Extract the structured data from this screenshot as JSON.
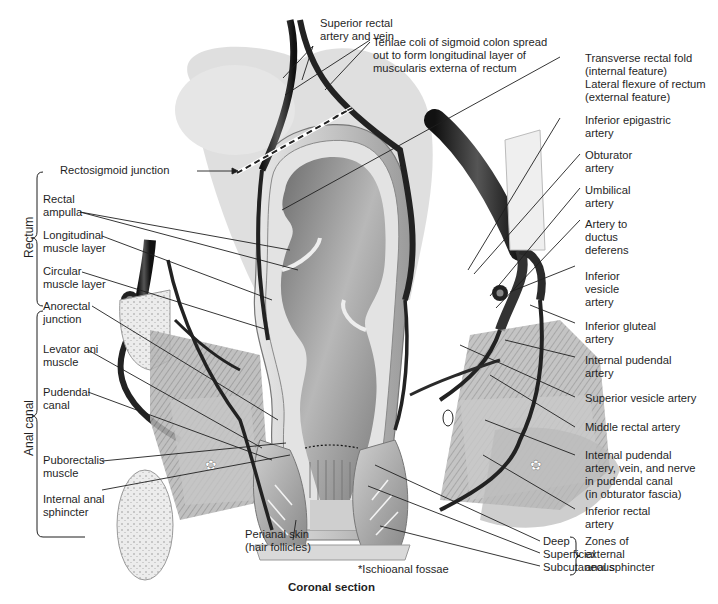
{
  "figure": {
    "caption": "Coronal section",
    "footnote": "*Ischioanal fossae"
  },
  "groups": {
    "rectum": "Rectum",
    "anal_canal": "Anal canal",
    "zones": "Zones of\nexternal\nanal sphincter"
  },
  "labels_top": {
    "superior_rectal": "Superior rectal\nartery and vein",
    "teniae_coli": "Teniae coli of sigmoid colon spread\nout to form longitudinal layer of\nmuscularis externa of rectum",
    "rectosigmoid": "Rectosigmoid junction"
  },
  "labels_left": [
    {
      "id": "rectal-ampulla",
      "text": "Rectal\nampulla"
    },
    {
      "id": "longitudinal-muscle-layer",
      "text": "Longitudinal\nmuscle layer"
    },
    {
      "id": "circular-muscle-layer",
      "text": "Circular\nmuscle layer"
    },
    {
      "id": "anorectal-junction",
      "text": "Anorectal\njunction"
    },
    {
      "id": "levator-ani-muscle",
      "text": "Levator ani\nmuscle"
    },
    {
      "id": "pudendal-canal",
      "text": "Pudendal\ncanal"
    },
    {
      "id": "puborectalis-muscle",
      "text": "Puborectalis\nmuscle"
    },
    {
      "id": "internal-anal-sphincter",
      "text": "Internal anal\nsphincter"
    }
  ],
  "labels_right": [
    {
      "id": "transverse-rectal-fold",
      "text": "Transverse rectal fold\n(internal feature)\nLateral flexure of rectum\n(external feature)"
    },
    {
      "id": "inferior-epigastric-artery",
      "text": "Inferior epigastric\nartery"
    },
    {
      "id": "obturator-artery",
      "text": "Obturator\nartery"
    },
    {
      "id": "umbilical-artery",
      "text": "Umbilical\nartery"
    },
    {
      "id": "artery-to-ductus-deferens",
      "text": "Artery to\nductus\ndeferens"
    },
    {
      "id": "inferior-vesicle-artery",
      "text": "Inferior\nvesicle\nartery"
    },
    {
      "id": "inferior-gluteal-artery",
      "text": "Inferior gluteal\nartery"
    },
    {
      "id": "internal-pudendal-artery",
      "text": "Internal pudendal\nartery"
    },
    {
      "id": "superior-vesicle-artery",
      "text": "Superior vesicle artery"
    },
    {
      "id": "middle-rectal-artery",
      "text": "Middle rectal artery"
    },
    {
      "id": "internal-pudendal-avn",
      "text": "Internal pudendal\nartery, vein, and nerve\nin pudendal canal\n(in obturator fascia)"
    },
    {
      "id": "inferior-rectal-artery",
      "text": "Inferior rectal\nartery"
    }
  ],
  "labels_bottom": {
    "perianal_skin": "Perianal skin\n(hair follicles)",
    "deep": "Deep",
    "superficial": "Superficial",
    "subcutaneous": "Subcutaneous"
  },
  "colors": {
    "ink": "#1f1f1f",
    "vessel": "#2a2a2a",
    "tissue_light": "#d6d6d6",
    "tissue_mid": "#a8a8a8",
    "lumen": "#8c8c8c"
  }
}
